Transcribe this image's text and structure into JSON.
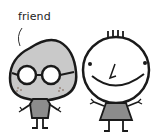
{
  "illustration": {
    "label_text": "friend",
    "characters": [
      {
        "name": "friend",
        "description": "gray pear-shaped character with round glasses and freckles, gray shirt",
        "body_color": "#c9c9c9",
        "shirt_color": "#8c8c8c"
      },
      {
        "name": "smiling-character",
        "description": "round white face with big smile, hair strands, gray dress",
        "face_color": "#ffffff",
        "dress_color": "#8c8c8c"
      }
    ],
    "colors": {
      "outline": "#1a1a1a",
      "background": "#ffffff"
    }
  }
}
